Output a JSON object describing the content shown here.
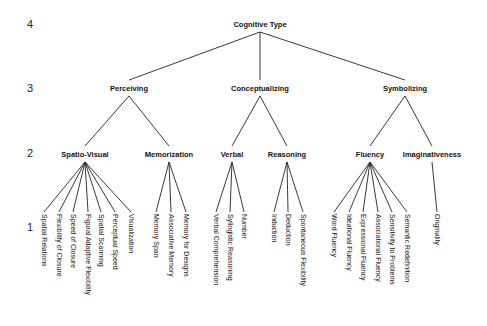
{
  "level_labels": [
    "4",
    "3",
    "2",
    "1"
  ],
  "root": {
    "label": "Cognitive Type",
    "x": 260
  },
  "level3": [
    {
      "label": "Perceiving",
      "x": 129
    },
    {
      "label": "Conceptualizing",
      "x": 260
    },
    {
      "label": "Symbolizing",
      "x": 405
    }
  ],
  "level2": [
    {
      "label": "Spatio-Visual",
      "x": 85,
      "parent": 0
    },
    {
      "label": "Memorization",
      "x": 169,
      "parent": 0
    },
    {
      "label": "Verbal",
      "x": 232,
      "parent": 1
    },
    {
      "label": "Reasoning",
      "x": 287,
      "parent": 1
    },
    {
      "label": "Fluency",
      "x": 370,
      "parent": 2
    },
    {
      "label": "Imaginativeness",
      "x": 432,
      "parent": 2
    }
  ],
  "leaves": [
    {
      "label": "Spatial Relations",
      "x": 44,
      "parent": 0
    },
    {
      "label": "Flexibility of Closure",
      "x": 59,
      "parent": 0
    },
    {
      "label": "Speed of Closure",
      "x": 73,
      "parent": 0
    },
    {
      "label": "Figural Adaptive Flexibility",
      "x": 88,
      "parent": 0
    },
    {
      "label": "Spatial Scanning",
      "x": 101,
      "parent": 0
    },
    {
      "label": "Perceptual Speed",
      "x": 115,
      "parent": 0
    },
    {
      "label": "Visualization",
      "x": 131,
      "parent": 0
    },
    {
      "label": "Memory Span",
      "x": 156,
      "parent": 1
    },
    {
      "label": "Associative Memory",
      "x": 171,
      "parent": 1
    },
    {
      "label": "Memory for Designs",
      "x": 186,
      "parent": 1
    },
    {
      "label": "Verbal Comprehension",
      "x": 216,
      "parent": 2
    },
    {
      "label": "Syllogistic Reasoning",
      "x": 230,
      "parent": 2
    },
    {
      "label": "Number",
      "x": 244,
      "parent": 2
    },
    {
      "label": "Induction",
      "x": 274,
      "parent": 3
    },
    {
      "label": "Deduction",
      "x": 288,
      "parent": 3
    },
    {
      "label": "Spontaneous Flexibility",
      "x": 303,
      "parent": 3
    },
    {
      "label": "Word Fluency",
      "x": 334,
      "parent": 4
    },
    {
      "label": "Ideational Fluency",
      "x": 349,
      "parent": 4
    },
    {
      "label": "Expressional Fluency",
      "x": 363,
      "parent": 4
    },
    {
      "label": "Associational Fluency",
      "x": 378,
      "parent": 4
    },
    {
      "label": "Sensitivity to Problems",
      "x": 392,
      "parent": 4
    },
    {
      "label": "Semantic Redefinition",
      "x": 407,
      "parent": 4
    },
    {
      "label": "Originality",
      "x": 437,
      "parent": 5
    }
  ],
  "colors": {
    "line": "#222222",
    "text": "#111111",
    "background": "#ffffff"
  }
}
